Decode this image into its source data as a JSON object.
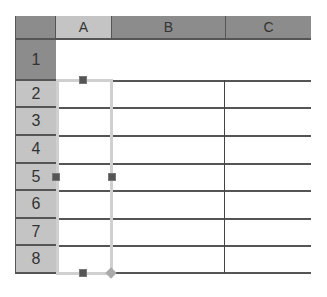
{
  "spreadsheet": {
    "columns": [
      {
        "label": "A",
        "selected": true
      },
      {
        "label": "B",
        "selected": false
      },
      {
        "label": "C",
        "selected": false
      }
    ],
    "rows": [
      {
        "label": "1"
      },
      {
        "label": "2"
      },
      {
        "label": "3"
      },
      {
        "label": "4"
      },
      {
        "label": "5"
      },
      {
        "label": "6"
      },
      {
        "label": "7"
      },
      {
        "label": "8"
      }
    ],
    "selection": {
      "range": "A2:A8"
    },
    "colors": {
      "header_dark": "#8c8c8c",
      "header_selected": "#c4c4c4",
      "grid_line": "#555555",
      "selection_border": "#d0d0d0",
      "handle": "#555555"
    }
  }
}
